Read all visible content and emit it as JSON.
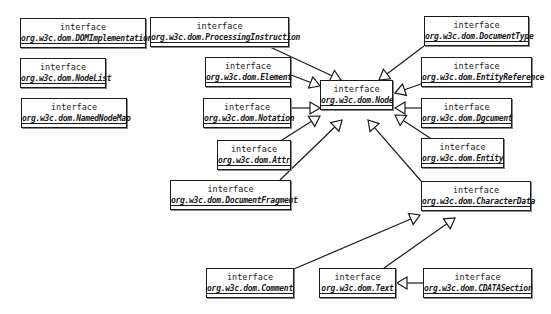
{
  "diagram": {
    "type": "uml-class-diagram",
    "stereotype": "interface",
    "classes": [
      {
        "id": "dom-implementation",
        "name": "org.w3c.dom.DOMImplementation",
        "x": 20,
        "y": 18,
        "w": 126,
        "h": 30
      },
      {
        "id": "node-list",
        "name": "org.w3c.dom.NodeList",
        "x": 20,
        "y": 58,
        "w": 86,
        "h": 30
      },
      {
        "id": "named-node-map",
        "name": "org.w3c.dom.NamedNodeMap",
        "x": 21,
        "y": 98,
        "w": 106,
        "h": 30
      },
      {
        "id": "processing-instruction",
        "name": "org.w3c.dom.ProcessingInstruction",
        "x": 150,
        "y": 17,
        "w": 139,
        "h": 30
      },
      {
        "id": "element",
        "name": "org.w3c.dom.Element",
        "x": 205,
        "y": 57,
        "w": 86,
        "h": 30
      },
      {
        "id": "notation",
        "name": "org.w3c.dom.Notation",
        "x": 203,
        "y": 98,
        "w": 88,
        "h": 30
      },
      {
        "id": "attr",
        "name": "org.w3c.dom.Attr",
        "x": 217,
        "y": 140,
        "w": 74,
        "h": 30
      },
      {
        "id": "document-fragment",
        "name": "org.w3c.dom.DocumentFragment",
        "x": 170,
        "y": 180,
        "w": 121,
        "h": 30
      },
      {
        "id": "node",
        "name": "org.w3c.dom.Node",
        "x": 320,
        "y": 80,
        "w": 73,
        "h": 30
      },
      {
        "id": "document-type",
        "name": "org.w3c.dom.DocumentType",
        "x": 424,
        "y": 16,
        "w": 105,
        "h": 30
      },
      {
        "id": "entity-reference",
        "name": "org.w3c.dom.EntityReference",
        "x": 421,
        "y": 57,
        "w": 111,
        "h": 30
      },
      {
        "id": "document",
        "name": "org.w3c.dom.Dgcument",
        "x": 421,
        "y": 98,
        "w": 91,
        "h": 30
      },
      {
        "id": "entity",
        "name": "org.w3c.dom.Entity",
        "x": 421,
        "y": 138,
        "w": 83,
        "h": 30
      },
      {
        "id": "character-data",
        "name": "org.w3c.dom.CharacterData",
        "x": 421,
        "y": 181,
        "w": 110,
        "h": 30
      },
      {
        "id": "comment",
        "name": "org.w3c.dom.Comment",
        "x": 206,
        "y": 268,
        "w": 88,
        "h": 30
      },
      {
        "id": "text",
        "name": "org.w3c.dom.Text",
        "x": 319,
        "y": 268,
        "w": 77,
        "h": 30
      },
      {
        "id": "cdata-section",
        "name": "org.w3c.dom.CDATASection",
        "x": 423,
        "y": 268,
        "w": 109,
        "h": 30
      }
    ],
    "generalizations": [
      {
        "from": "processing-instruction",
        "to": "node",
        "path": [
          [
            270,
            47
          ],
          [
            341,
            80
          ]
        ]
      },
      {
        "from": "element",
        "to": "node",
        "path": [
          [
            291,
            75
          ],
          [
            320,
            86
          ]
        ]
      },
      {
        "from": "notation",
        "to": "node",
        "path": [
          [
            291,
            108
          ],
          [
            320,
            108
          ]
        ]
      },
      {
        "from": "attr",
        "to": "node",
        "path": [
          [
            282,
            140
          ],
          [
            320,
            116
          ]
        ]
      },
      {
        "from": "document-fragment",
        "to": "node",
        "path": [
          [
            280,
            180
          ],
          [
            342,
            120
          ]
        ]
      },
      {
        "from": "document-type",
        "to": "node",
        "path": [
          [
            424,
            46
          ],
          [
            379,
            80
          ]
        ]
      },
      {
        "from": "entity-reference",
        "to": "node",
        "path": [
          [
            421,
            84
          ],
          [
            395,
            93
          ]
        ]
      },
      {
        "from": "document",
        "to": "node",
        "path": [
          [
            421,
            108
          ],
          [
            395,
            108
          ]
        ]
      },
      {
        "from": "entity",
        "to": "node",
        "path": [
          [
            430,
            138
          ],
          [
            395,
            115
          ]
        ]
      },
      {
        "from": "character-data",
        "to": "node",
        "path": [
          [
            421,
            181
          ],
          [
            368,
            120
          ]
        ]
      },
      {
        "from": "comment",
        "to": "character-data",
        "path": [
          [
            294,
            269
          ],
          [
            420,
            215
          ]
        ]
      },
      {
        "from": "text",
        "to": "character-data",
        "path": [
          [
            384,
            268
          ],
          [
            455,
            218
          ]
        ]
      },
      {
        "from": "cdata-section",
        "to": "text",
        "path": [
          [
            423,
            283
          ],
          [
            397,
            283
          ]
        ]
      }
    ]
  }
}
